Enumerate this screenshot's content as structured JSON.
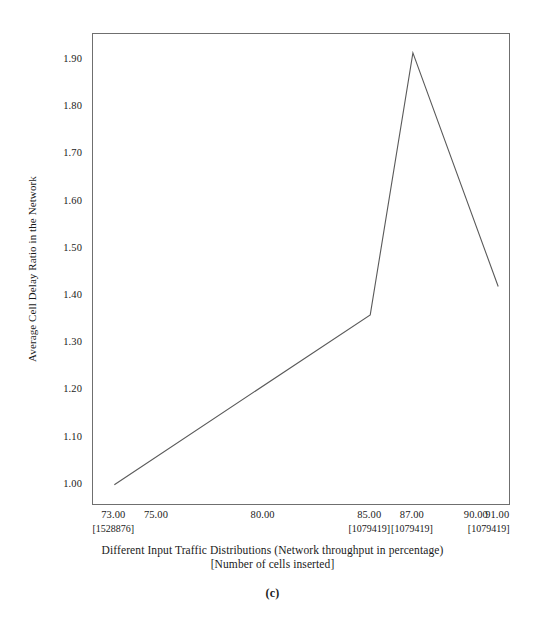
{
  "chart_data": {
    "type": "line",
    "title": "",
    "xlabel": "Different Input Traffic Distributions (Network throughput in percentage) [Number of cells inserted]",
    "xlabel_line1": "Different Input Traffic Distributions (Network throughput in percentage)",
    "xlabel_line2": "[Number of cells inserted]",
    "ylabel": "Average Cell Delay Ratio in the Network",
    "grid": false,
    "legend": "none",
    "xlim": [
      72.0,
      91.6
    ],
    "ylim": [
      0.955,
      1.955
    ],
    "x_tick_labels": [
      "73.00",
      "75.00",
      "80.00",
      "85.00",
      "87.00",
      "90.00",
      "91.00"
    ],
    "x_tick_values": [
      73.0,
      75.0,
      80.0,
      85.0,
      87.0,
      90.0,
      91.0
    ],
    "x_bracket_labels": [
      {
        "text": "[1528876]",
        "x": 73.0
      },
      {
        "text": "[1079419]",
        "x": 85.0
      },
      {
        "text": "[1079419]",
        "x": 87.0
      },
      {
        "text": "[1079419]",
        "x": 90.6
      }
    ],
    "y_tick_labels": [
      "1.00",
      "1.10",
      "1.20",
      "1.30",
      "1.40",
      "1.50",
      "1.60",
      "1.70",
      "1.80",
      "1.90"
    ],
    "y_tick_values": [
      1.0,
      1.1,
      1.2,
      1.3,
      1.4,
      1.5,
      1.6,
      1.7,
      1.8,
      1.9
    ],
    "series": [
      {
        "name": "Average Cell Delay Ratio",
        "x": [
          73.0,
          85.0,
          87.0,
          91.0
        ],
        "values": [
          1.0,
          1.36,
          1.915,
          1.42
        ]
      }
    ],
    "line_color": "#5a5a5a",
    "frame_color": "#6f6f6f",
    "background_color": "#ffffff"
  },
  "caption": {
    "label": "(c)"
  }
}
